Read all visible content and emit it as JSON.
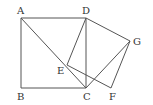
{
  "diagram": {
    "type": "geometry",
    "points": {
      "A": {
        "label": "A",
        "x": 21,
        "y": 18,
        "lx": 17,
        "ly": 14
      },
      "B": {
        "label": "B",
        "x": 21,
        "y": 88,
        "lx": 17,
        "ly": 100
      },
      "C": {
        "label": "C",
        "x": 86,
        "y": 88,
        "lx": 83,
        "ly": 100
      },
      "D": {
        "label": "D",
        "x": 86,
        "y": 18,
        "lx": 82,
        "ly": 14
      },
      "E": {
        "label": "E",
        "x": 67,
        "y": 65,
        "lx": 57,
        "ly": 74
      },
      "F": {
        "label": "F",
        "x": 111,
        "y": 88,
        "lx": 109,
        "ly": 100
      },
      "G": {
        "label": "G",
        "x": 130,
        "y": 41,
        "lx": 133,
        "ly": 45
      }
    },
    "segments": [
      [
        "A",
        "B"
      ],
      [
        "B",
        "C"
      ],
      [
        "C",
        "D"
      ],
      [
        "D",
        "A"
      ],
      [
        "A",
        "C"
      ],
      [
        "D",
        "E"
      ],
      [
        "D",
        "G"
      ],
      [
        "G",
        "F"
      ],
      [
        "E",
        "F"
      ],
      [
        "C",
        "G"
      ]
    ]
  }
}
